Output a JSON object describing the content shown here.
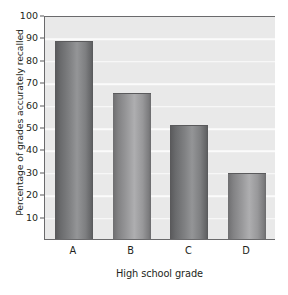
{
  "chart_data": {
    "type": "bar",
    "title": "",
    "xlabel": "High school grade",
    "ylabel": "Percentage of grades accurately recalled",
    "categories": [
      "A",
      "B",
      "C",
      "D"
    ],
    "values": [
      88.5,
      65,
      51,
      29.5
    ],
    "ylim": [
      0,
      100
    ],
    "yticks": [
      10,
      20,
      30,
      40,
      50,
      60,
      70,
      80,
      90,
      100
    ],
    "ytick_labels": [
      "10",
      "20",
      "30",
      "40",
      "50",
      "60",
      "70",
      "80",
      "90",
      "100"
    ],
    "grid": true,
    "grid_color": "#fbfbfb",
    "legend": "none",
    "plot_background": "#e9e9e9",
    "bar_colors": [
      "#8d8d8f",
      "#9a9a9c",
      "#7c7d7f",
      "#9a9a9c"
    ],
    "bar_shades": [
      "dark",
      "light",
      "dark",
      "light"
    ],
    "axis_color": "#6a6a6c",
    "text_color": "#231f20"
  }
}
